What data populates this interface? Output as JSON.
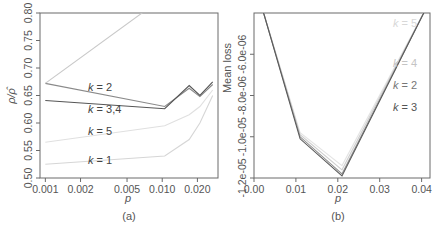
{
  "chart_data": [
    {
      "panel": "(a)",
      "type": "line",
      "xlabel": "p",
      "ylabel": "ρ/ρ̂",
      "xscale": "log",
      "xlim": [
        0.0009,
        0.03
      ],
      "ylim": [
        0.5,
        0.8
      ],
      "xticks": [
        0.001,
        0.002,
        0.005,
        0.01,
        0.02
      ],
      "xtick_labels": [
        "0.001",
        "0.002",
        "0.005",
        "0.010",
        "0.020"
      ],
      "yticks": [
        0.5,
        0.55,
        0.6,
        0.65,
        0.7,
        0.75,
        0.8
      ],
      "ytick_labels": [
        "0.50",
        "0.55",
        "0.60",
        "0.65",
        "0.70",
        "0.75",
        "0.80"
      ],
      "grid": false,
      "x": [
        0.001,
        0.0105,
        0.017,
        0.021,
        0.027
      ],
      "series": [
        {
          "name": "k=2",
          "label": "k = 2",
          "color": "#8a8a8a",
          "values": [
            0.672,
            0.63,
            0.663,
            0.648,
            0.67
          ]
        },
        {
          "name": "k=3,4",
          "label": "k = 3,4",
          "color": "#555555",
          "values": [
            0.641,
            0.626,
            0.668,
            0.65,
            0.675
          ]
        },
        {
          "name": "k=5",
          "label": "k = 5",
          "color": "#e0e0e0",
          "values": [
            0.565,
            0.595,
            0.615,
            0.63,
            0.66
          ]
        },
        {
          "name": "k=1",
          "label": "k = 1",
          "color": "#d6d6d6",
          "values": [
            0.525,
            0.54,
            0.57,
            0.6,
            0.65
          ]
        },
        {
          "name": "upper",
          "label": "",
          "color": "#c8c8c8",
          "values": [
            0.672,
            0.83,
            null,
            null,
            null
          ]
        }
      ]
    },
    {
      "panel": "(b)",
      "type": "line",
      "xlabel": "p",
      "ylabel": "Mean loss",
      "xlim": [
        0.0,
        0.042
      ],
      "ylim": [
        -1.2e-05,
        -4e-06
      ],
      "xticks": [
        0.0,
        0.01,
        0.02,
        0.03,
        0.04
      ],
      "xtick_labels": [
        "0.00",
        "0.01",
        "0.02",
        "0.03",
        "0.04"
      ],
      "yticks": [
        -1.2e-05,
        -1e-05,
        -8e-06,
        -6e-06
      ],
      "ytick_labels": [
        "-1.2e-05",
        "-1.0e-05",
        "-8.0e-06",
        "-6.0e-06"
      ],
      "grid": false,
      "x": [
        0.002,
        0.011,
        0.021,
        0.041
      ],
      "series": [
        {
          "name": "k=5",
          "label": "k = 5",
          "color": "#e4e4e4",
          "values": [
            -3.8e-06,
            -9.8e-06,
            -1.14e-05,
            -3.8e-06
          ]
        },
        {
          "name": "k=4",
          "label": "k = 4",
          "color": "#cfcfcf",
          "values": [
            -3.8e-06,
            -9.9e-06,
            -1.16e-05,
            -3.8e-06
          ]
        },
        {
          "name": "k=2",
          "label": "k = 2",
          "color": "#8f8f8f",
          "values": [
            -3.8e-06,
            -1e-05,
            -1.18e-05,
            -3.8e-06
          ]
        },
        {
          "name": "k=3",
          "label": "k = 3",
          "color": "#5a5a5a",
          "values": [
            -3.8e-06,
            -1.01e-05,
            -1.19e-05,
            -3.8e-06
          ]
        }
      ]
    }
  ]
}
